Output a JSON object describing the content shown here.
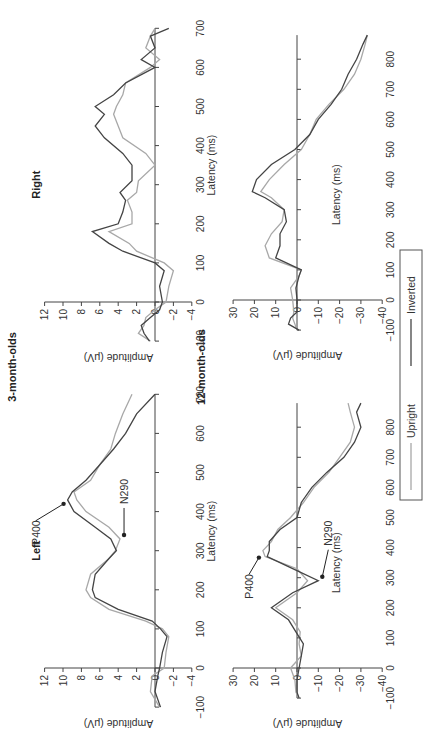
{
  "figure": {
    "group_titles": {
      "three_month": "3-month-olds",
      "twelve_month": "12-month-olds"
    },
    "panel_titles": {
      "left": "Left",
      "right": "Right"
    },
    "xlabel": "Latency (ms)",
    "ylabel": "Amplitude (μV)",
    "legend": {
      "upright": "Upright",
      "inverted": "Inverted"
    },
    "annotations": {
      "p400": "P400",
      "n290": "N290"
    },
    "colors": {
      "upright": "#a8a8a8",
      "inverted": "#444444"
    },
    "orientation": "rotated 90 degrees counter-clockwise"
  },
  "chart_data": [
    {
      "type": "line",
      "title": "3-month-olds — Left",
      "xlabel": "Latency (ms)",
      "ylabel": "Amplitude (μV)",
      "xlim": [
        -100,
        700
      ],
      "ylim": [
        -4,
        12
      ],
      "xticks": [
        -100,
        0,
        100,
        200,
        300,
        400,
        500,
        600,
        700
      ],
      "yticks": [
        -4,
        -2,
        0,
        2,
        4,
        6,
        8,
        10,
        12
      ],
      "x": [
        -100,
        -60,
        -20,
        0,
        40,
        80,
        100,
        120,
        150,
        180,
        200,
        240,
        280,
        300,
        330,
        360,
        400,
        430,
        450,
        480,
        520,
        560,
        600,
        650,
        700
      ],
      "series": [
        {
          "name": "Upright",
          "values": [
            -0.5,
            0.5,
            0.3,
            -1.0,
            -1.2,
            -1.5,
            -0.8,
            1.0,
            5.0,
            7.0,
            7.5,
            7.0,
            5.0,
            4.3,
            3.8,
            5.0,
            7.5,
            8.5,
            8.8,
            7.0,
            6.0,
            4.8,
            4.3,
            3.5,
            2.5
          ]
        },
        {
          "name": "Inverted",
          "values": [
            -0.6,
            0.0,
            -0.3,
            -0.5,
            -0.8,
            -1.3,
            -0.6,
            0.3,
            4.0,
            6.5,
            6.8,
            6.5,
            5.0,
            4.2,
            4.8,
            6.5,
            8.8,
            9.5,
            9.0,
            7.5,
            6.0,
            4.5,
            3.2,
            2.0,
            0.0
          ]
        }
      ],
      "annotations": [
        {
          "label": "P400",
          "x": 430,
          "y": 9.5,
          "arrow": true
        },
        {
          "label": "N290",
          "x": 330,
          "y": 3.8,
          "arrow": true
        }
      ]
    },
    {
      "type": "line",
      "title": "3-month-olds — Right",
      "xlabel": "Latency (ms)",
      "ylabel": "Amplitude (μV)",
      "xlim": [
        -100,
        700
      ],
      "ylim": [
        -4,
        12
      ],
      "xticks": [
        -100,
        0,
        100,
        200,
        300,
        400,
        500,
        600,
        700
      ],
      "yticks": [
        -4,
        -2,
        0,
        2,
        4,
        6,
        8,
        10,
        12
      ],
      "x": [
        -100,
        -80,
        -60,
        -40,
        -20,
        0,
        40,
        80,
        100,
        130,
        150,
        180,
        200,
        230,
        260,
        280,
        310,
        350,
        380,
        420,
        450,
        480,
        500,
        530,
        560,
        600,
        620,
        650,
        680,
        700
      ],
      "series": [
        {
          "name": "Upright",
          "values": [
            0.5,
            1.8,
            1.2,
            1.0,
            0.0,
            -1.2,
            -1.5,
            -2.0,
            -1.0,
            2.0,
            2.8,
            5.0,
            2.5,
            2.5,
            3.0,
            2.0,
            1.8,
            0.0,
            1.0,
            3.5,
            4.0,
            4.5,
            4.2,
            3.5,
            3.2,
            0.5,
            -0.5,
            1.0,
            0.5,
            0.0
          ]
        },
        {
          "name": "Inverted",
          "values": [
            0.6,
            1.2,
            1.5,
            0.5,
            -0.5,
            -0.8,
            -0.5,
            -1.0,
            0.0,
            3.5,
            5.0,
            6.8,
            4.0,
            3.5,
            3.2,
            3.8,
            2.5,
            2.5,
            3.5,
            5.5,
            6.5,
            5.5,
            6.5,
            4.5,
            3.2,
            0.0,
            1.5,
            0.0,
            0.5,
            -1.5
          ]
        }
      ]
    },
    {
      "type": "line",
      "title": "12-month-olds — Left",
      "xlabel": "Latency (ms)",
      "ylabel": "Amplitude (μV)",
      "xlim": [
        -100,
        900
      ],
      "ylim": [
        -40,
        30
      ],
      "xticks": [
        -100,
        0,
        100,
        200,
        300,
        400,
        500,
        600,
        700,
        800
      ],
      "yticks": [
        -40,
        -30,
        -20,
        -10,
        0,
        10,
        20,
        30
      ],
      "x": [
        -100,
        -80,
        -40,
        0,
        40,
        80,
        120,
        160,
        200,
        250,
        290,
        330,
        370,
        390,
        420,
        460,
        500,
        550,
        600,
        650,
        700,
        750,
        800,
        850,
        880
      ],
      "series": [
        {
          "name": "Upright",
          "values": [
            -1.0,
            0.5,
            1.0,
            3.0,
            -2.0,
            -1.0,
            -1.5,
            2.0,
            10.0,
            0.0,
            -5.0,
            0.0,
            15.0,
            16.0,
            12.0,
            9.0,
            3.0,
            -3.0,
            -8.0,
            -15.0,
            -20.0,
            -25.0,
            -27.0,
            -25.0,
            -24.0
          ]
        },
        {
          "name": "Inverted",
          "values": [
            -1.0,
            0.0,
            0.0,
            -1.0,
            -2.0,
            -3.0,
            0.5,
            4.0,
            12.0,
            2.0,
            -10.0,
            2.0,
            14.0,
            13.0,
            13.0,
            8.0,
            0.0,
            -2.0,
            -7.0,
            -14.0,
            -22.0,
            -27.0,
            -30.0,
            -28.0,
            -30.0
          ]
        }
      ],
      "annotations": [
        {
          "label": "P400",
          "x": 380,
          "y": 16,
          "arrow": true
        },
        {
          "label": "N290",
          "x": 290,
          "y": -10,
          "arrow": true
        }
      ]
    },
    {
      "type": "line",
      "title": "12-month-olds — Right",
      "xlabel": "Latency (ms)",
      "ylabel": "Amplitude (μV)",
      "xlim": [
        -100,
        900
      ],
      "ylim": [
        -40,
        30
      ],
      "xticks": [
        -100,
        0,
        100,
        200,
        300,
        400,
        500,
        600,
        700,
        800
      ],
      "yticks": [
        -40,
        -30,
        -20,
        -10,
        0,
        10,
        20,
        30
      ],
      "x": [
        -100,
        -80,
        -60,
        -40,
        0,
        40,
        80,
        100,
        140,
        180,
        220,
        260,
        300,
        340,
        360,
        400,
        450,
        500,
        550,
        600,
        650,
        700,
        750,
        800,
        850,
        880
      ],
      "series": [
        {
          "name": "Upright",
          "values": [
            0.0,
            1.0,
            2.0,
            1.5,
            2.0,
            3.0,
            -1.0,
            -2.0,
            13.0,
            15.0,
            12.0,
            7.0,
            6.0,
            12.0,
            17.0,
            13.0,
            6.0,
            -2.0,
            -6.0,
            -9.0,
            -15.0,
            -22.0,
            -27.0,
            -30.0,
            -32.0,
            -33.0
          ]
        },
        {
          "name": "Inverted",
          "values": [
            -1.0,
            4.0,
            3.0,
            0.0,
            0.0,
            0.5,
            -1.0,
            -2.0,
            10.0,
            8.0,
            8.0,
            5.0,
            6.0,
            15.0,
            21.0,
            19.0,
            12.0,
            1.0,
            -6.0,
            -10.0,
            -16.0,
            -21.0,
            -24.0,
            -28.0,
            -31.0,
            -33.0
          ]
        }
      ]
    }
  ]
}
